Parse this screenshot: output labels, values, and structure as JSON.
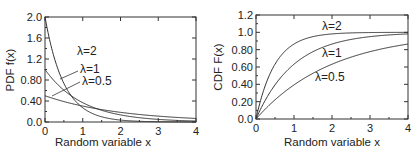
{
  "chart_data": [
    {
      "type": "line",
      "title": "",
      "xlabel": "Random variable x",
      "ylabel": "PDF f(x)",
      "xlim": [
        0,
        4
      ],
      "ylim": [
        0,
        2.0
      ],
      "xticks": [
        "0",
        "1",
        "2",
        "3",
        "4"
      ],
      "yticks": [
        "0.0",
        "0.40",
        "0.80",
        "1.2",
        "1.6",
        "2.0"
      ],
      "grid": false,
      "series": [
        {
          "name": "λ=2",
          "lambda": 2,
          "formula": "2*exp(-2x)",
          "x": [
            0,
            0.5,
            1,
            1.5,
            2,
            3,
            4
          ],
          "values": [
            2.0,
            0.736,
            0.271,
            0.1,
            0.037,
            0.005,
            0.001
          ]
        },
        {
          "name": "λ=1",
          "lambda": 1,
          "formula": "exp(-x)",
          "x": [
            0,
            0.5,
            1,
            1.5,
            2,
            3,
            4
          ],
          "values": [
            1.0,
            0.607,
            0.368,
            0.223,
            0.135,
            0.05,
            0.018
          ]
        },
        {
          "name": "λ=0.5",
          "lambda": 0.5,
          "formula": "0.5*exp(-0.5x)",
          "x": [
            0,
            0.5,
            1,
            1.5,
            2,
            3,
            4
          ],
          "values": [
            0.5,
            0.389,
            0.303,
            0.236,
            0.184,
            0.112,
            0.068
          ]
        }
      ],
      "annotations": [
        "λ=2",
        "λ=1",
        "λ=0.5"
      ]
    },
    {
      "type": "line",
      "title": "",
      "xlabel": "Random variable x",
      "ylabel": "CDF F(x)",
      "xlim": [
        0,
        4
      ],
      "ylim": [
        0,
        1.2
      ],
      "xticks": [
        "0",
        "1",
        "2",
        "3",
        "4"
      ],
      "yticks": [
        "0.0",
        "0.20",
        "0.40",
        "0.60",
        "0.80",
        "1.0",
        "1.2"
      ],
      "grid": false,
      "series": [
        {
          "name": "λ=2",
          "lambda": 2,
          "formula": "1-exp(-2x)",
          "x": [
            0,
            0.5,
            1,
            1.5,
            2,
            3,
            4
          ],
          "values": [
            0,
            0.632,
            0.865,
            0.95,
            0.982,
            0.998,
            1.0
          ]
        },
        {
          "name": "λ=1",
          "lambda": 1,
          "formula": "1-exp(-x)",
          "x": [
            0,
            0.5,
            1,
            1.5,
            2,
            3,
            4
          ],
          "values": [
            0,
            0.393,
            0.632,
            0.777,
            0.865,
            0.95,
            0.982
          ]
        },
        {
          "name": "λ=0.5",
          "lambda": 0.5,
          "formula": "1-exp(-0.5x)",
          "x": [
            0,
            0.5,
            1,
            1.5,
            2,
            3,
            4
          ],
          "values": [
            0,
            0.221,
            0.393,
            0.528,
            0.632,
            0.777,
            0.865
          ]
        }
      ],
      "annotations": [
        "λ=2",
        "λ=1",
        "λ=0.5"
      ]
    }
  ]
}
